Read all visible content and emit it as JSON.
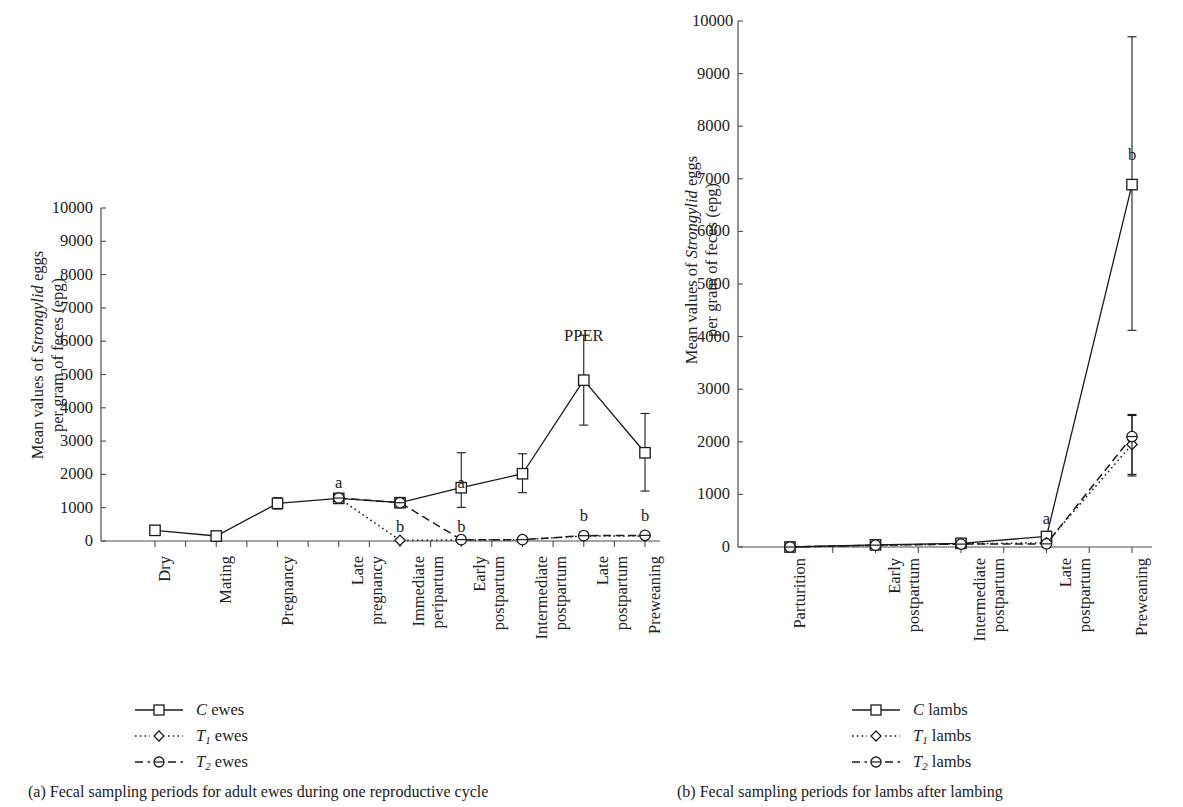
{
  "figure": {
    "y_axis_title_line1_prefix": "Mean values of ",
    "y_axis_title_line1_italic": "Strongylid",
    "y_axis_title_line1_suffix": " eggs",
    "y_axis_title_line2": "per gram of feces (epg)",
    "axis_color": "#4d4d4d",
    "series_color": "#1a1a1a"
  },
  "panel_a": {
    "caption": "(a)  Fecal sampling periods for adult ewes during one reproductive cycle",
    "legend": [
      {
        "label_prefix": "C",
        "label_sub": "",
        "label_suffix": " ewes",
        "key": "solid-square-key",
        "style": "solid",
        "marker": "square"
      },
      {
        "label_prefix": "T",
        "label_sub": "1",
        "label_suffix": " ewes",
        "key": "dotted-diamond-key",
        "style": "dotted",
        "marker": "diamond"
      },
      {
        "label_prefix": "T",
        "label_sub": "2",
        "label_suffix": " ewes",
        "key": "dashed-circle-key",
        "style": "dashed",
        "marker": "circle"
      }
    ],
    "annotations": [
      {
        "text": "PPER",
        "x_index": 7,
        "value": 6150
      },
      {
        "text": "a",
        "x_index": 3,
        "value": 1750
      },
      {
        "text": "a",
        "x_index": 5,
        "value": 1750
      },
      {
        "text": "b",
        "x_index": 4,
        "value": 420
      },
      {
        "text": "b",
        "x_index": 5,
        "value": 420
      },
      {
        "text": "b",
        "x_index": 7,
        "value": 760
      },
      {
        "text": "b",
        "x_index": 8,
        "value": 760
      }
    ]
  },
  "panel_b": {
    "caption": "(b)  Fecal sampling periods for lambs after lambing",
    "legend": [
      {
        "label_prefix": "C",
        "label_sub": "",
        "label_suffix": " lambs",
        "key": "solid-square-key",
        "style": "solid",
        "marker": "square"
      },
      {
        "label_prefix": "T",
        "label_sub": "1",
        "label_suffix": " lambs",
        "key": "dotted-diamond-key",
        "style": "dotted",
        "marker": "diamond"
      },
      {
        "label_prefix": "T",
        "label_sub": "2",
        "label_suffix": " lambs",
        "key": "dashed-circle-key",
        "style": "dashed",
        "marker": "circle"
      }
    ],
    "annotations": [
      {
        "text": "b",
        "x_index": 4,
        "value": 7450
      },
      {
        "text": "a",
        "x_index": 3,
        "value": 530
      }
    ]
  },
  "chart_data": [
    {
      "type": "line",
      "id": "panel-a",
      "title": "(a)  Fecal sampling periods for adult ewes during one reproductive cycle",
      "xlabel": "",
      "ylabel": "Mean values of Strongylid eggs per gram of feces (epg)",
      "ylim": [
        0,
        10000
      ],
      "yticks": [
        0,
        1000,
        2000,
        3000,
        4000,
        5000,
        6000,
        7000,
        8000,
        9000,
        10000
      ],
      "grid": false,
      "legend_position": "below-left",
      "categories": [
        [
          "Dry"
        ],
        [
          "Mating"
        ],
        [
          "Pregnancy"
        ],
        [
          "Late",
          "pregnancy"
        ],
        [
          "Immediate",
          "peripartum"
        ],
        [
          "Early",
          "postpartum"
        ],
        [
          "Intermediate",
          "postpartum"
        ],
        [
          "Late",
          "postpartum"
        ],
        [
          "Preweaning"
        ]
      ],
      "series": [
        {
          "name": "C ewes",
          "style": "solid",
          "marker": "square",
          "values": [
            320,
            150,
            1130,
            1280,
            1150,
            1600,
            2020,
            4830,
            2650
          ],
          "err_low": [
            320,
            150,
            960,
            1150,
            1020,
            1010,
            1450,
            3480,
            1500
          ],
          "err_high": [
            320,
            150,
            1300,
            1420,
            1280,
            2650,
            2620,
            6180,
            3830
          ]
        },
        {
          "name": "T1 ewes",
          "style": "dotted",
          "marker": "diamond",
          "values": [
            null,
            null,
            null,
            1290,
            20,
            30,
            40,
            150,
            150
          ],
          "err_low": [
            null,
            null,
            null,
            1190,
            20,
            30,
            40,
            90,
            150
          ],
          "err_high": [
            null,
            null,
            null,
            1390,
            20,
            30,
            40,
            230,
            150
          ]
        },
        {
          "name": "T2 ewes",
          "style": "dashed",
          "marker": "circle",
          "values": [
            null,
            null,
            null,
            1290,
            1150,
            40,
            40,
            160,
            170
          ],
          "err_low": [
            null,
            null,
            null,
            1190,
            1020,
            40,
            40,
            100,
            170
          ],
          "err_high": [
            null,
            null,
            null,
            1390,
            1280,
            40,
            40,
            240,
            170
          ]
        }
      ],
      "annotations": [
        {
          "text": "PPER",
          "x_index": 7,
          "value": 6150
        },
        {
          "text": "a",
          "x_index": 3,
          "value": 1750
        },
        {
          "text": "a",
          "x_index": 5,
          "value": 1750
        },
        {
          "text": "b",
          "x_index": 4,
          "value": 420
        },
        {
          "text": "b",
          "x_index": 5,
          "value": 420
        },
        {
          "text": "b",
          "x_index": 7,
          "value": 760
        },
        {
          "text": "b",
          "x_index": 8,
          "value": 760
        }
      ]
    },
    {
      "type": "line",
      "id": "panel-b",
      "title": "(b)  Fecal sampling periods for lambs after lambing",
      "xlabel": "",
      "ylabel": "Mean values of Strongylid eggs per gram of feces (epg)",
      "ylim": [
        0,
        10000
      ],
      "yticks": [
        0,
        1000,
        2000,
        3000,
        4000,
        5000,
        6000,
        7000,
        8000,
        9000,
        10000
      ],
      "grid": false,
      "legend_position": "below-center",
      "categories": [
        [
          "Parturition"
        ],
        [
          "Early",
          "postpartum"
        ],
        [
          "Intermediate",
          "postpartum"
        ],
        [
          "Late",
          "postpartum"
        ],
        [
          "Preweaning"
        ]
      ],
      "series": [
        {
          "name": "C lambs",
          "style": "solid",
          "marker": "square",
          "values": [
            0,
            40,
            70,
            200,
            6890
          ],
          "err_low": [
            0,
            40,
            70,
            140,
            4120
          ],
          "err_high": [
            0,
            40,
            70,
            260,
            9700
          ]
        },
        {
          "name": "T1 lambs",
          "style": "dotted",
          "marker": "diamond",
          "values": [
            0,
            30,
            60,
            80,
            1950
          ],
          "err_low": [
            0,
            30,
            60,
            80,
            1350
          ],
          "err_high": [
            0,
            30,
            60,
            80,
            2500
          ]
        },
        {
          "name": "T2 lambs",
          "style": "dashed",
          "marker": "circle",
          "values": [
            0,
            35,
            55,
            60,
            2100
          ],
          "err_low": [
            0,
            35,
            55,
            60,
            1380
          ],
          "err_high": [
            0,
            35,
            55,
            60,
            2520
          ]
        }
      ],
      "annotations": [
        {
          "text": "b",
          "x_index": 4,
          "value": 7450
        },
        {
          "text": "a",
          "x_index": 3,
          "value": 530
        }
      ]
    }
  ]
}
